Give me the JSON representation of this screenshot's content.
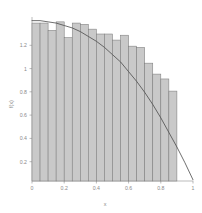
{
  "chart_data": {
    "type": "bar",
    "title": "",
    "subtitle": "",
    "xlabel": "x",
    "ylabel": "f(x)",
    "xlim": [
      0,
      1
    ],
    "ylim": [
      0,
      1.35
    ],
    "xticks": [
      0,
      0.2,
      0.4,
      0.6,
      0.8,
      1
    ],
    "xticklabels": [
      "0",
      "0.2",
      "0.4",
      "0.6",
      "0.8",
      "1"
    ],
    "yticks": [
      0.2,
      0.4,
      0.6,
      0.8,
      1,
      1.2
    ],
    "yticklabels": [
      "0.2",
      "0.4",
      "0.6",
      "0.8",
      "1",
      "1.2"
    ],
    "grid": false,
    "legend": null,
    "bar_fill_color": "#c9c9c9",
    "bar_edge_color": "#7d7d7d",
    "curve_color": "#4a4a4a",
    "axis_color": "#8f8f8f",
    "background_color": "#ffffff",
    "bin_width": 0.05,
    "categories": [
      "0.00-0.05",
      "0.05-0.10",
      "0.10-0.15",
      "0.15-0.20",
      "0.20-0.25",
      "0.25-0.30",
      "0.30-0.35",
      "0.35-0.40",
      "0.40-0.45",
      "0.45-0.50",
      "0.50-0.55",
      "0.55-0.60",
      "0.60-0.65",
      "0.65-0.70",
      "0.70-0.75",
      "0.75-0.80",
      "0.80-0.85",
      "0.85-0.90"
    ],
    "bin_left_edges": [
      0.0,
      0.05,
      0.1,
      0.15,
      0.2,
      0.25,
      0.3,
      0.35,
      0.4,
      0.45,
      0.5,
      0.55,
      0.6,
      0.65,
      0.7,
      0.75,
      0.8,
      0.85
    ],
    "values": [
      1.3,
      1.3,
      1.24,
      1.31,
      1.18,
      1.3,
      1.29,
      1.25,
      1.21,
      1.21,
      1.16,
      1.2,
      1.11,
      1.1,
      0.97,
      0.88,
      0.84,
      0.74
    ],
    "series": [
      {
        "name": "histogram",
        "type": "bar",
        "values": [
          1.3,
          1.3,
          1.24,
          1.31,
          1.18,
          1.3,
          1.29,
          1.25,
          1.21,
          1.21,
          1.16,
          1.2,
          1.11,
          1.1,
          0.97,
          0.88,
          0.84,
          0.74
        ]
      },
      {
        "name": "density-curve",
        "type": "line",
        "x": [
          0.0,
          0.05,
          0.1,
          0.15,
          0.2,
          0.25,
          0.3,
          0.35,
          0.4,
          0.45,
          0.5,
          0.55,
          0.6,
          0.65,
          0.7,
          0.75,
          0.8,
          0.85,
          0.9,
          0.95,
          1.0
        ],
        "y": [
          1.32,
          1.32,
          1.31,
          1.3,
          1.28,
          1.26,
          1.23,
          1.19,
          1.15,
          1.1,
          1.04,
          0.98,
          0.9,
          0.82,
          0.73,
          0.63,
          0.52,
          0.4,
          0.28,
          0.15,
          0.01
        ]
      }
    ]
  }
}
